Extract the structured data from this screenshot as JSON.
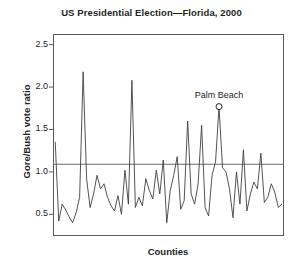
{
  "chart_data": {
    "type": "line",
    "title": "US Presidential Election—Florida, 2000",
    "xlabel": "Counties",
    "ylabel": "Gore/Bush vote ratio",
    "ylim": [
      0.25,
      2.62
    ],
    "xlim": [
      0,
      66
    ],
    "yticks": [
      0.5,
      1.0,
      1.5,
      2.0,
      2.5
    ],
    "ytick_labels": [
      "0.5",
      "1.0",
      "1.5",
      "2.0",
      "2.5"
    ],
    "xticks": [],
    "xtick_labels": [],
    "grid": false,
    "legend": false,
    "frame": true,
    "reference_line": {
      "orientation": "horizontal",
      "value": 1.09,
      "label": ""
    },
    "annotations": [
      {
        "text": "Palm Beach",
        "x_index": 47,
        "y": 1.77,
        "marker": "open-circle"
      }
    ],
    "series": [
      {
        "name": "Gore/Bush vote ratio",
        "color": "#404040",
        "values": [
          1.35,
          0.42,
          0.62,
          0.55,
          0.47,
          0.4,
          0.52,
          0.7,
          2.18,
          0.92,
          0.58,
          0.74,
          0.96,
          0.8,
          0.86,
          0.7,
          0.6,
          0.54,
          0.72,
          0.5,
          1.02,
          0.62,
          2.08,
          0.58,
          0.7,
          0.6,
          0.92,
          0.78,
          0.68,
          1.02,
          0.74,
          1.14,
          0.4,
          0.78,
          0.96,
          1.18,
          0.56,
          0.66,
          1.6,
          0.74,
          0.62,
          0.86,
          1.55,
          0.58,
          0.48,
          0.96,
          1.12,
          1.77,
          1.05,
          1.0,
          0.8,
          0.46,
          1.0,
          0.62,
          1.26,
          0.54,
          0.74,
          0.88,
          0.8,
          1.22,
          0.64,
          0.7,
          0.86,
          0.76,
          0.58,
          0.62
        ]
      }
    ]
  },
  "axes": {
    "frame_color": "#5a5a5a",
    "line_color": "#404040",
    "reference_color": "#6b6b6b",
    "text_color": "#231f20"
  }
}
